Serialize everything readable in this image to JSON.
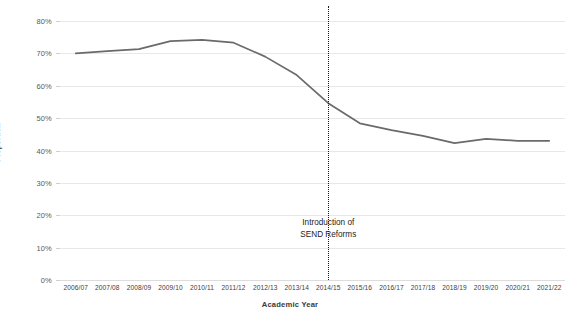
{
  "chart_data": {
    "type": "line",
    "title": "",
    "xlabel": "Academic Year",
    "ylabel": "Proportion",
    "categories": [
      "2006/07",
      "2007/08",
      "2008/09",
      "2009/10",
      "2010/11",
      "2011/12",
      "2012/13",
      "2013/14",
      "2014/15",
      "2015/16",
      "2016/17",
      "2017/18",
      "2018/19",
      "2019/20",
      "2020/21",
      "2021/22"
    ],
    "values": [
      70,
      70.7,
      71.3,
      73.8,
      74.2,
      73.3,
      69,
      63.3,
      54.6,
      48.4,
      46.3,
      44.5,
      42.3,
      43.6,
      43,
      43
    ],
    "series": [
      {
        "name": "Proportion",
        "values": [
          70,
          70.7,
          71.3,
          73.8,
          74.2,
          73.3,
          69,
          63.3,
          54.6,
          48.4,
          46.3,
          44.5,
          42.3,
          43.6,
          43,
          43
        ],
        "color": "#6a6a6a"
      }
    ],
    "ylim": [
      0,
      80
    ],
    "yticks": [
      0,
      10,
      20,
      30,
      40,
      50,
      60,
      70,
      80
    ],
    "ytick_labels": [
      "0%",
      "10%",
      "20%",
      "30%",
      "40%",
      "50%",
      "60%",
      "70%",
      "80%"
    ],
    "grid": true,
    "legend": false,
    "annotations": [
      {
        "name": "send-reforms-marker",
        "at_category": "2014/15",
        "line_style": "dotted",
        "line_color": "#1a1a1a",
        "text_line_1": "Introduction of",
        "text_line_2": "SEND Reforms"
      }
    ]
  }
}
